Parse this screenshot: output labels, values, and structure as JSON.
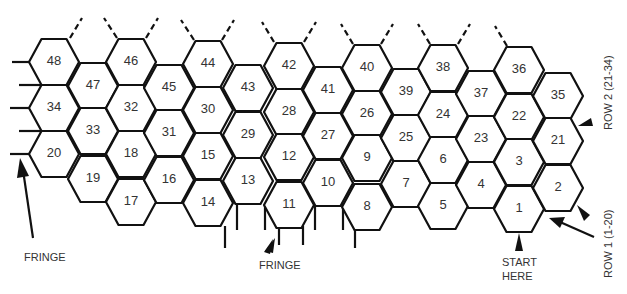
{
  "diagram": {
    "hex_size": {
      "radius": 25,
      "half_height": 23
    },
    "hexagons": [
      {
        "n": "48",
        "x": 54,
        "y": 62
      },
      {
        "n": "34",
        "x": 54,
        "y": 108
      },
      {
        "n": "20",
        "x": 54,
        "y": 154
      },
      {
        "n": "47",
        "x": 93,
        "y": 86
      },
      {
        "n": "33",
        "x": 93,
        "y": 131
      },
      {
        "n": "19",
        "x": 93,
        "y": 179
      },
      {
        "n": "46",
        "x": 131,
        "y": 62
      },
      {
        "n": "32",
        "x": 131,
        "y": 108
      },
      {
        "n": "18",
        "x": 131,
        "y": 154
      },
      {
        "n": "17",
        "x": 131,
        "y": 202
      },
      {
        "n": "45",
        "x": 169,
        "y": 88
      },
      {
        "n": "31",
        "x": 169,
        "y": 133
      },
      {
        "n": "16",
        "x": 169,
        "y": 180
      },
      {
        "n": "44",
        "x": 208,
        "y": 64
      },
      {
        "n": "30",
        "x": 208,
        "y": 110
      },
      {
        "n": "15",
        "x": 208,
        "y": 156
      },
      {
        "n": "14",
        "x": 208,
        "y": 203
      },
      {
        "n": "43",
        "x": 248,
        "y": 88
      },
      {
        "n": "29",
        "x": 248,
        "y": 135
      },
      {
        "n": "13",
        "x": 248,
        "y": 181
      },
      {
        "n": "42",
        "x": 289,
        "y": 66
      },
      {
        "n": "28",
        "x": 289,
        "y": 112
      },
      {
        "n": "12",
        "x": 289,
        "y": 157
      },
      {
        "n": "11",
        "x": 289,
        "y": 205
      },
      {
        "n": "41",
        "x": 328,
        "y": 90
      },
      {
        "n": "27",
        "x": 328,
        "y": 136
      },
      {
        "n": "10",
        "x": 328,
        "y": 183
      },
      {
        "n": "40",
        "x": 367,
        "y": 68
      },
      {
        "n": "26",
        "x": 367,
        "y": 114
      },
      {
        "n": "9",
        "x": 367,
        "y": 158
      },
      {
        "n": "8",
        "x": 367,
        "y": 207
      },
      {
        "n": "39",
        "x": 406,
        "y": 92
      },
      {
        "n": "25",
        "x": 406,
        "y": 138
      },
      {
        "n": "7",
        "x": 406,
        "y": 184
      },
      {
        "n": "38",
        "x": 443,
        "y": 68
      },
      {
        "n": "24",
        "x": 443,
        "y": 115
      },
      {
        "n": "6",
        "x": 443,
        "y": 160
      },
      {
        "n": "5",
        "x": 443,
        "y": 206
      },
      {
        "n": "37",
        "x": 481,
        "y": 94
      },
      {
        "n": "23",
        "x": 481,
        "y": 139
      },
      {
        "n": "4",
        "x": 481,
        "y": 185
      },
      {
        "n": "36",
        "x": 519,
        "y": 70
      },
      {
        "n": "22",
        "x": 519,
        "y": 117
      },
      {
        "n": "3",
        "x": 519,
        "y": 162
      },
      {
        "n": "1",
        "x": 519,
        "y": 209
      },
      {
        "n": "35",
        "x": 558,
        "y": 96
      },
      {
        "n": "21",
        "x": 558,
        "y": 141
      },
      {
        "n": "2",
        "x": 558,
        "y": 188
      }
    ],
    "labels": {
      "fringe_left": "FRINGE",
      "fringe_bottom": "FRINGE",
      "start_line1": "START",
      "start_line2": "HERE",
      "row1": "ROW 1 (1-20)",
      "row2": "ROW 2 (21-34)"
    },
    "colors": {
      "stroke": "#111111",
      "text": "#333333",
      "background": "#ffffff"
    }
  }
}
